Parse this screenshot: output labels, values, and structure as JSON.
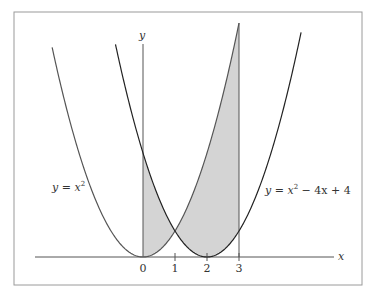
{
  "figure": {
    "frame": {
      "x": 14,
      "y": 12,
      "width": 348,
      "height": 273,
      "stroke": "#9a9a9a"
    },
    "axes": {
      "origin_px": [
        143,
        257
      ],
      "x_unit_px": 32,
      "y_unit_px": 26,
      "x_axis": {
        "from_px": 35,
        "to_px": 334,
        "label": "x"
      },
      "y_axis": {
        "from_py": 257,
        "to_py": 28,
        "label": "y"
      },
      "x_ticks": [
        "0",
        "1",
        "2",
        "3"
      ]
    },
    "curves": [
      {
        "name": "parabola-x-squared",
        "label": "y = x²",
        "label_parts": {
          "lhs": "y",
          "eq": " = ",
          "base": "x",
          "exp": "2"
        },
        "x_range": [
          -2.84,
          3.0
        ],
        "color": "#555555"
      },
      {
        "name": "parabola-shifted",
        "label": "y = x² − 4x + 4",
        "label_parts": {
          "lhs": "y",
          "eq": " = ",
          "base": "x",
          "exp": "2",
          "rest": " − 4x + 4"
        },
        "x_range": [
          -0.86,
          4.95
        ],
        "color": "#222222"
      }
    ],
    "shaded_region": {
      "description": "area between y=x^2 and y=x^2-4x+4 from x=0 to x=3",
      "x_from": 0,
      "x_to": 3,
      "fill": "#d4d4d4"
    }
  },
  "chart_data": {
    "type": "line",
    "title": "",
    "xlabel": "x",
    "ylabel": "y",
    "x_ticks": [
      0,
      1,
      2,
      3
    ],
    "series": [
      {
        "name": "y = x^2",
        "x": [
          -2.8,
          -2,
          -1,
          0,
          1,
          2,
          3
        ],
        "values": [
          7.84,
          4,
          1,
          0,
          1,
          4,
          9
        ]
      },
      {
        "name": "y = x^2 - 4x + 4",
        "x": [
          -0.8,
          0,
          1,
          2,
          3,
          4,
          4.9
        ],
        "values": [
          7.84,
          4,
          1,
          0,
          1,
          4,
          8.41
        ]
      }
    ],
    "annotations": [
      "shaded area between curves from x=0 to x=3",
      "intersection at (1, 1)"
    ]
  }
}
